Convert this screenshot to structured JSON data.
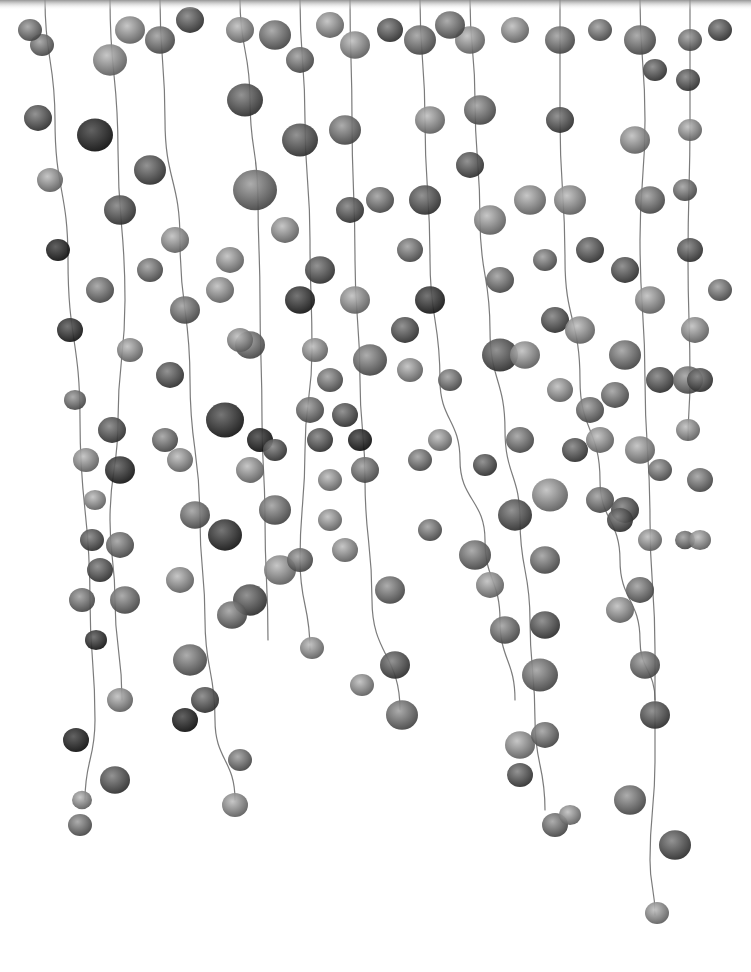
{
  "image": {
    "subject": "watercolor hanging vines with round leaves",
    "palette": [
      "#1f1f1f",
      "#3a3a3a",
      "#555555",
      "#707070",
      "#8c8c8c",
      "#a8a8a8",
      "#c4c4c4"
    ],
    "background": "#ffffff",
    "top_band_color": "#6e6e6e"
  },
  "vines": [
    {
      "points": [
        [
          45,
          0
        ],
        [
          55,
          120
        ],
        [
          68,
          260
        ],
        [
          80,
          420
        ],
        [
          90,
          600
        ],
        [
          95,
          720
        ],
        [
          85,
          800
        ]
      ],
      "pearls": [
        [
          42,
          45,
          12,
          2
        ],
        [
          38,
          118,
          14,
          1
        ],
        [
          50,
          180,
          13,
          3
        ],
        [
          58,
          250,
          12,
          4
        ],
        [
          70,
          330,
          13,
          0
        ],
        [
          75,
          400,
          11,
          2
        ],
        [
          86,
          460,
          13,
          3
        ],
        [
          92,
          540,
          12,
          1
        ],
        [
          82,
          600,
          13,
          2
        ],
        [
          96,
          640,
          11,
          0
        ],
        [
          76,
          740,
          13,
          4
        ],
        [
          82,
          800,
          10,
          3
        ],
        [
          80,
          825,
          12,
          2
        ]
      ]
    },
    {
      "points": [
        [
          110,
          0
        ],
        [
          118,
          150
        ],
        [
          125,
          300
        ],
        [
          118,
          420
        ],
        [
          110,
          520
        ],
        [
          115,
          600
        ],
        [
          122,
          700
        ]
      ],
      "pearls": [
        [
          110,
          60,
          17,
          3
        ],
        [
          95,
          135,
          18,
          4
        ],
        [
          120,
          210,
          16,
          1
        ],
        [
          100,
          290,
          14,
          2
        ],
        [
          130,
          350,
          13,
          3
        ],
        [
          112,
          430,
          14,
          1
        ],
        [
          120,
          470,
          15,
          0
        ],
        [
          95,
          500,
          11,
          3
        ],
        [
          120,
          545,
          14,
          2
        ],
        [
          100,
          570,
          13,
          1
        ],
        [
          125,
          600,
          15,
          2
        ],
        [
          120,
          700,
          13,
          3
        ],
        [
          115,
          780,
          15,
          1
        ]
      ]
    },
    {
      "points": [
        [
          160,
          0
        ],
        [
          165,
          120
        ],
        [
          180,
          240
        ],
        [
          190,
          380
        ],
        [
          200,
          520
        ],
        [
          205,
          620
        ],
        [
          215,
          720
        ],
        [
          235,
          800
        ]
      ],
      "pearls": [
        [
          160,
          40,
          15,
          2
        ],
        [
          150,
          170,
          16,
          1
        ],
        [
          175,
          240,
          14,
          3
        ],
        [
          185,
          310,
          15,
          2
        ],
        [
          170,
          375,
          14,
          1
        ],
        [
          180,
          460,
          13,
          3
        ],
        [
          195,
          515,
          15,
          2
        ],
        [
          225,
          535,
          17,
          0
        ],
        [
          180,
          580,
          14,
          3
        ],
        [
          190,
          660,
          17,
          2
        ],
        [
          205,
          700,
          14,
          1
        ],
        [
          185,
          720,
          13,
          4
        ],
        [
          240,
          760,
          12,
          2
        ],
        [
          235,
          805,
          13,
          3
        ]
      ]
    },
    {
      "points": [
        [
          240,
          0
        ],
        [
          250,
          100
        ],
        [
          258,
          200
        ],
        [
          260,
          300
        ],
        [
          262,
          420
        ],
        [
          265,
          520
        ],
        [
          268,
          640
        ]
      ],
      "pearls": [
        [
          240,
          30,
          14,
          3
        ],
        [
          245,
          100,
          18,
          1
        ],
        [
          255,
          190,
          22,
          2
        ],
        [
          230,
          260,
          14,
          3
        ],
        [
          250,
          345,
          15,
          2
        ],
        [
          225,
          420,
          19,
          0
        ],
        [
          260,
          440,
          13,
          4
        ],
        [
          275,
          510,
          16,
          2
        ],
        [
          280,
          570,
          16,
          3
        ],
        [
          250,
          600,
          17,
          1
        ],
        [
          232,
          615,
          15,
          2
        ]
      ]
    },
    {
      "points": [
        [
          300,
          0
        ],
        [
          305,
          120
        ],
        [
          310,
          240
        ],
        [
          312,
          350
        ],
        [
          305,
          450
        ],
        [
          300,
          560
        ],
        [
          310,
          650
        ]
      ],
      "pearls": [
        [
          300,
          60,
          14,
          2
        ],
        [
          300,
          140,
          18,
          1
        ],
        [
          285,
          230,
          14,
          3
        ],
        [
          300,
          300,
          15,
          0
        ],
        [
          315,
          350,
          13,
          3
        ],
        [
          310,
          410,
          14,
          2
        ],
        [
          320,
          440,
          13,
          1
        ],
        [
          330,
          480,
          12,
          3
        ],
        [
          300,
          560,
          13,
          2
        ],
        [
          312,
          648,
          12,
          3
        ]
      ]
    },
    {
      "points": [
        [
          350,
          0
        ],
        [
          352,
          120
        ],
        [
          355,
          260
        ],
        [
          360,
          380
        ],
        [
          365,
          480
        ],
        [
          372,
          600
        ],
        [
          400,
          710
        ]
      ],
      "pearls": [
        [
          355,
          45,
          15,
          3
        ],
        [
          345,
          130,
          16,
          2
        ],
        [
          350,
          210,
          14,
          1
        ],
        [
          355,
          300,
          15,
          3
        ],
        [
          370,
          360,
          17,
          2
        ],
        [
          345,
          415,
          13,
          1
        ],
        [
          360,
          440,
          12,
          4
        ],
        [
          365,
          470,
          14,
          2
        ],
        [
          345,
          550,
          13,
          3
        ],
        [
          390,
          590,
          15,
          2
        ],
        [
          395,
          665,
          15,
          1
        ],
        [
          402,
          715,
          16,
          2
        ],
        [
          362,
          685,
          12,
          3
        ]
      ]
    },
    {
      "points": [
        [
          420,
          0
        ],
        [
          425,
          120
        ],
        [
          430,
          260
        ],
        [
          440,
          380
        ],
        [
          460,
          460
        ],
        [
          485,
          540
        ],
        [
          500,
          620
        ],
        [
          515,
          700
        ]
      ],
      "pearls": [
        [
          420,
          40,
          16,
          2
        ],
        [
          430,
          120,
          15,
          3
        ],
        [
          425,
          200,
          16,
          1
        ],
        [
          410,
          250,
          13,
          2
        ],
        [
          430,
          300,
          15,
          0
        ],
        [
          410,
          370,
          13,
          3
        ],
        [
          450,
          380,
          12,
          2
        ],
        [
          440,
          440,
          12,
          3
        ],
        [
          485,
          465,
          12,
          1
        ],
        [
          475,
          555,
          16,
          2
        ],
        [
          490,
          585,
          14,
          3
        ],
        [
          505,
          630,
          15,
          2
        ]
      ]
    },
    {
      "points": [
        [
          470,
          0
        ],
        [
          475,
          100
        ],
        [
          480,
          220
        ],
        [
          490,
          330
        ],
        [
          505,
          430
        ],
        [
          520,
          520
        ],
        [
          530,
          620
        ],
        [
          535,
          720
        ],
        [
          545,
          810
        ]
      ],
      "pearls": [
        [
          470,
          40,
          15,
          3
        ],
        [
          480,
          110,
          16,
          2
        ],
        [
          470,
          165,
          14,
          1
        ],
        [
          490,
          220,
          16,
          3
        ],
        [
          500,
          280,
          14,
          2
        ],
        [
          500,
          355,
          18,
          1
        ],
        [
          525,
          355,
          15,
          3
        ],
        [
          520,
          440,
          14,
          2
        ],
        [
          515,
          515,
          17,
          1
        ],
        [
          550,
          495,
          18,
          3
        ],
        [
          545,
          560,
          15,
          2
        ],
        [
          545,
          625,
          15,
          1
        ],
        [
          540,
          675,
          18,
          2
        ],
        [
          520,
          745,
          15,
          3
        ],
        [
          545,
          735,
          14,
          2
        ],
        [
          520,
          775,
          13,
          1
        ],
        [
          555,
          825,
          13,
          2
        ],
        [
          570,
          815,
          11,
          3
        ]
      ]
    },
    {
      "points": [
        [
          560,
          0
        ],
        [
          560,
          120
        ],
        [
          565,
          260
        ],
        [
          580,
          380
        ],
        [
          600,
          480
        ],
        [
          620,
          560
        ],
        [
          640,
          640
        ],
        [
          655,
          700
        ]
      ],
      "pearls": [
        [
          560,
          40,
          15,
          2
        ],
        [
          560,
          120,
          14,
          1
        ],
        [
          570,
          200,
          16,
          3
        ],
        [
          545,
          260,
          12,
          2
        ],
        [
          555,
          320,
          14,
          1
        ],
        [
          580,
          330,
          15,
          3
        ],
        [
          590,
          410,
          14,
          2
        ],
        [
          575,
          450,
          13,
          1
        ],
        [
          600,
          500,
          14,
          2
        ],
        [
          620,
          610,
          14,
          3
        ],
        [
          645,
          665,
          15,
          2
        ],
        [
          655,
          715,
          15,
          1
        ]
      ]
    },
    {
      "points": [
        [
          640,
          0
        ],
        [
          645,
          120
        ],
        [
          640,
          240
        ],
        [
          645,
          380
        ],
        [
          650,
          520
        ],
        [
          655,
          650
        ],
        [
          655,
          760
        ],
        [
          650,
          860
        ],
        [
          655,
          915
        ]
      ],
      "pearls": [
        [
          640,
          40,
          16,
          2
        ],
        [
          655,
          70,
          12,
          1
        ],
        [
          635,
          140,
          15,
          3
        ],
        [
          650,
          200,
          15,
          2
        ],
        [
          625,
          270,
          14,
          1
        ],
        [
          650,
          300,
          15,
          3
        ],
        [
          625,
          355,
          16,
          2
        ],
        [
          660,
          380,
          14,
          1
        ],
        [
          640,
          450,
          15,
          3
        ],
        [
          660,
          470,
          12,
          2
        ],
        [
          625,
          510,
          14,
          1
        ],
        [
          650,
          540,
          12,
          3
        ],
        [
          640,
          590,
          14,
          2
        ],
        [
          630,
          800,
          16,
          2
        ],
        [
          675,
          845,
          16,
          1
        ],
        [
          657,
          913,
          12,
          3
        ]
      ]
    },
    {
      "points": [
        [
          690,
          0
        ],
        [
          690,
          120
        ],
        [
          688,
          260
        ],
        [
          690,
          380
        ],
        [
          688,
          440
        ]
      ],
      "pearls": [
        [
          690,
          40,
          12,
          2
        ],
        [
          688,
          80,
          12,
          1
        ],
        [
          690,
          130,
          12,
          3
        ],
        [
          685,
          190,
          12,
          2
        ],
        [
          690,
          250,
          13,
          1
        ],
        [
          695,
          330,
          14,
          3
        ],
        [
          688,
          380,
          15,
          2
        ],
        [
          688,
          430,
          12,
          3
        ],
        [
          685,
          540,
          10,
          2
        ]
      ]
    }
  ],
  "scatter": [
    [
      30,
      30,
      12,
      2
    ],
    [
      130,
      30,
      15,
      3
    ],
    [
      190,
      20,
      14,
      1
    ],
    [
      275,
      35,
      16,
      2
    ],
    [
      330,
      25,
      14,
      3
    ],
    [
      390,
      30,
      13,
      1
    ],
    [
      450,
      25,
      15,
      2
    ],
    [
      515,
      30,
      14,
      3
    ],
    [
      600,
      30,
      12,
      2
    ],
    [
      720,
      30,
      12,
      1
    ],
    [
      150,
      270,
      13,
      2
    ],
    [
      220,
      290,
      14,
      3
    ],
    [
      320,
      270,
      15,
      1
    ],
    [
      380,
      200,
      14,
      2
    ],
    [
      530,
      200,
      16,
      3
    ],
    [
      590,
      250,
      14,
      1
    ],
    [
      720,
      290,
      12,
      2
    ],
    [
      240,
      340,
      13,
      3
    ],
    [
      330,
      380,
      13,
      2
    ],
    [
      405,
      330,
      14,
      1
    ],
    [
      560,
      390,
      13,
      3
    ],
    [
      615,
      395,
      14,
      2
    ],
    [
      700,
      380,
      13,
      1
    ],
    [
      165,
      440,
      13,
      2
    ],
    [
      250,
      470,
      14,
      3
    ],
    [
      275,
      450,
      12,
      1
    ],
    [
      420,
      460,
      12,
      2
    ],
    [
      600,
      440,
      14,
      3
    ],
    [
      700,
      480,
      13,
      2
    ],
    [
      330,
      520,
      12,
      3
    ],
    [
      430,
      530,
      12,
      2
    ],
    [
      620,
      520,
      13,
      1
    ],
    [
      700,
      540,
      11,
      3
    ]
  ]
}
